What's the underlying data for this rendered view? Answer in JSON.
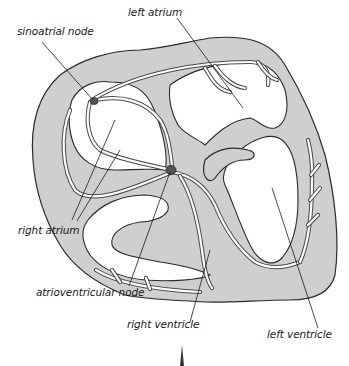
{
  "labels": {
    "sinoatrial_node": "sinoatrial node",
    "left_atrium": "left atrium",
    "right_atrium": "right atrium",
    "atrioventricular_node": "atrioventricular node",
    "right_ventricle": "right ventricle",
    "left_ventricle": "left ventricle"
  },
  "colors": {
    "wall": "#cfcfcf",
    "outline": "#2a2a2a",
    "chamber": "#ffffff",
    "text": "#1a1a1a"
  }
}
